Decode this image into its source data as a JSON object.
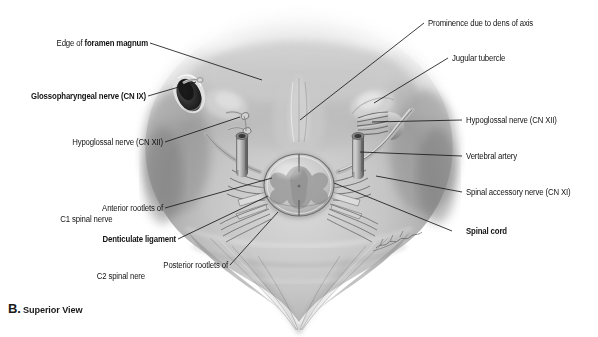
{
  "figure": {
    "caption_letter": "B.",
    "caption_text": "Superior View",
    "signature": "artist-signature"
  },
  "labels": {
    "foramen_magnum": {
      "prefix": "Edge of ",
      "emphasis": "foramen magnum"
    },
    "glossopharyngeal": "Glossopharyngeal nerve (CN IX)",
    "hypoglossal_left": "Hypoglossal nerve (CN XII)",
    "anterior_rootlets_line1": "Anterior rootlets of",
    "anterior_rootlets_line2": "C1 spinal nerve",
    "denticulate_ligament": "Denticulate ligament",
    "posterior_rootlets_line1": "Posterior rootlets of",
    "posterior_rootlets_line2": "C2 spinal nere",
    "dens_of_axis": "Prominence due to dens of axis",
    "jugular_tubercle": "Jugular tubercle",
    "hypoglossal_right": "Hypoglossal nerve (CN XII)",
    "vertebral_artery": "Vertebral artery",
    "spinal_accessory": "Spinal accessory nerve (CN XI)",
    "spinal_cord": "Spinal cord"
  },
  "colors": {
    "background": "#ffffff",
    "text": "#141414",
    "leader_line": "#1a1a1a",
    "specimen_light": "#e8e8e8",
    "specimen_mid": "#b4b4b4",
    "specimen_dark": "#6e6e6e",
    "specimen_shadow": "#3c3c3c"
  }
}
